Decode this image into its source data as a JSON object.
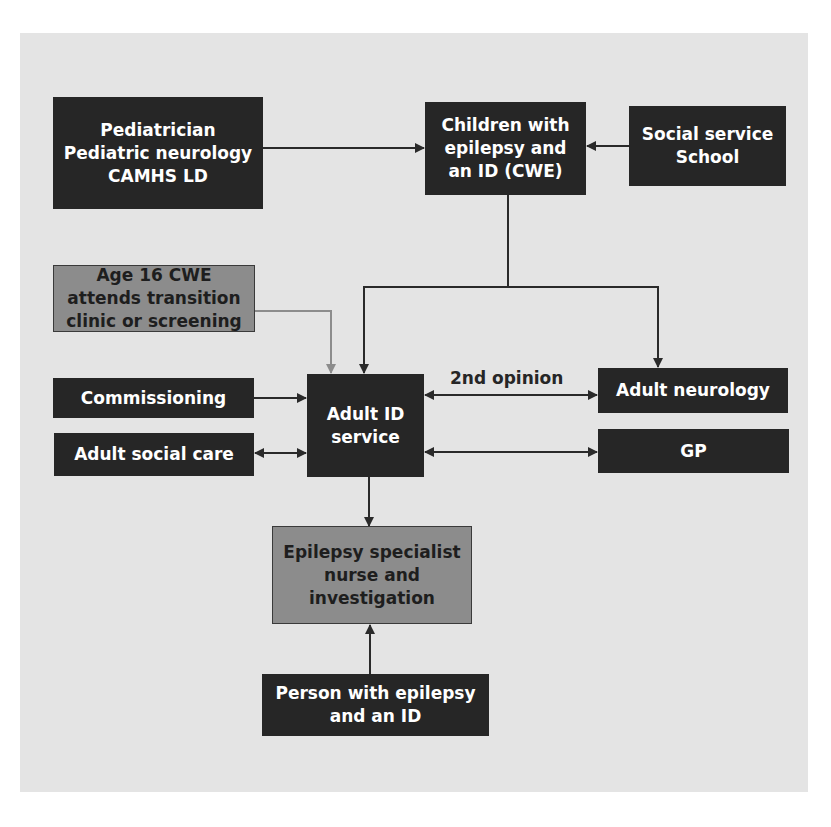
{
  "diagram": {
    "nodes": {
      "pediatrician": {
        "text": "Pediatrician\nPediatric neurology\nCAMHS LD",
        "style": "dark"
      },
      "cwe": {
        "text": "Children with\nepilepsy and\nan ID (CWE)",
        "style": "dark"
      },
      "social_service": {
        "text": "Social service\nSchool",
        "style": "dark"
      },
      "age16": {
        "text": "Age 16 CWE\nattends transition\nclinic or screening",
        "style": "grey"
      },
      "commissioning": {
        "text": "Commissioning",
        "style": "dark"
      },
      "adult_social_care": {
        "text": "Adult social care",
        "style": "dark"
      },
      "adult_id_service": {
        "text": "Adult ID\nservice",
        "style": "dark"
      },
      "adult_neurology": {
        "text": "Adult neurology",
        "style": "dark"
      },
      "gp": {
        "text": "GP",
        "style": "dark"
      },
      "epilepsy_nurse": {
        "text": "Epilepsy specialist\nnurse and\ninvestigation",
        "style": "grey"
      },
      "person": {
        "text": "Person with epilepsy\nand an ID",
        "style": "dark"
      }
    },
    "edge_labels": {
      "second_opinion": "2nd opinion"
    },
    "edges": [
      {
        "from": "pediatrician",
        "to": "cwe",
        "type": "one-way"
      },
      {
        "from": "social_service",
        "to": "cwe",
        "type": "one-way"
      },
      {
        "from": "cwe",
        "to": "adult_id_service",
        "type": "one-way"
      },
      {
        "from": "cwe",
        "to": "adult_neurology",
        "type": "one-way"
      },
      {
        "from": "age16",
        "to": "adult_id_service",
        "type": "one-way",
        "color": "grey"
      },
      {
        "from": "commissioning",
        "to": "adult_id_service",
        "type": "one-way"
      },
      {
        "from": "adult_social_care",
        "to": "adult_id_service",
        "type": "two-way"
      },
      {
        "from": "adult_id_service",
        "to": "adult_neurology",
        "type": "two-way",
        "label": "2nd opinion"
      },
      {
        "from": "adult_id_service",
        "to": "gp",
        "type": "two-way"
      },
      {
        "from": "adult_id_service",
        "to": "epilepsy_nurse",
        "type": "one-way"
      },
      {
        "from": "person",
        "to": "epilepsy_nurse",
        "type": "one-way"
      }
    ],
    "colors": {
      "background": "#e4e4e4",
      "dark_box": "#262626",
      "grey_box": "#8c8c8c",
      "line": "#2a2a2a",
      "grey_line": "#8c8c8c"
    }
  }
}
